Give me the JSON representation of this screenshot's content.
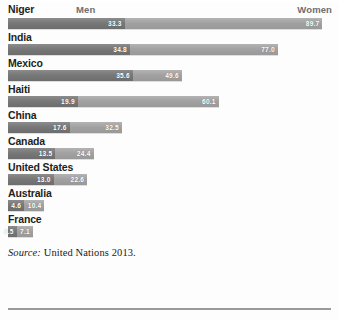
{
  "header": {
    "first_country": "Niger",
    "men_label": "Men",
    "women_label": "Women"
  },
  "source": {
    "prefix": "Source:",
    "text": " United Nations 2013."
  },
  "colors": {
    "men_bar": "#787878",
    "women_bar": "#a2a2a2",
    "label_text": "#231f20",
    "value_text": "#ffffff",
    "background": "#fdfdfd",
    "rule": "#9a9a9a"
  },
  "chart_data": {
    "type": "bar",
    "orientation": "horizontal",
    "stacked": false,
    "title": "",
    "subtitle": "",
    "xlabel": "",
    "ylabel": "",
    "xlim": [
      0,
      93
    ],
    "grid": false,
    "legend_position": "top",
    "note": "Each country has one bar; the dark left segment marks the Men value and the bar continues in a lighter tone to the Women value. Values are percentages.",
    "categories": [
      "Niger",
      "India",
      "Mexico",
      "Haiti",
      "China",
      "Canada",
      "United States",
      "Australia",
      "France"
    ],
    "series": [
      {
        "name": "Men",
        "values": [
          33.3,
          34.8,
          35.6,
          19.9,
          17.6,
          13.5,
          13.0,
          4.6,
          2.5
        ]
      },
      {
        "name": "Women",
        "values": [
          89.7,
          77.0,
          49.6,
          60.1,
          32.5,
          24.4,
          22.6,
          10.4,
          7.1
        ]
      }
    ],
    "rows": [
      {
        "label": "Niger",
        "men": 33.3,
        "women": 89.7,
        "men_text": "33.3",
        "women_text": "89.7"
      },
      {
        "label": "India",
        "men": 34.8,
        "women": 77.0,
        "men_text": "34.8",
        "women_text": "77.0"
      },
      {
        "label": "Mexico",
        "men": 35.6,
        "women": 49.6,
        "men_text": "35.6",
        "women_text": "49.6"
      },
      {
        "label": "Haiti",
        "men": 19.9,
        "women": 60.1,
        "men_text": "19.9",
        "women_text": "60.1"
      },
      {
        "label": "China",
        "men": 17.6,
        "women": 32.5,
        "men_text": "17.6",
        "women_text": "32.5"
      },
      {
        "label": "Canada",
        "men": 13.5,
        "women": 24.4,
        "men_text": "13.5",
        "women_text": "24.4"
      },
      {
        "label": "United States",
        "men": 13.0,
        "women": 22.6,
        "men_text": "13.0",
        "women_text": "22.6"
      },
      {
        "label": "Australia",
        "men": 4.6,
        "women": 10.4,
        "men_text": "4.6",
        "women_text": "10.4"
      },
      {
        "label": "France",
        "men": 2.5,
        "women": 7.1,
        "men_text": "2.5",
        "women_text": "7.1"
      }
    ]
  }
}
